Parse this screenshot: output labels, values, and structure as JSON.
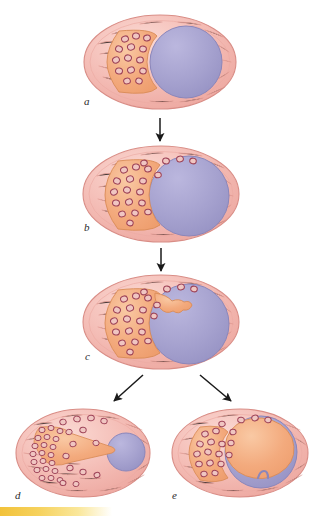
{
  "figure": {
    "type": "biomedical-illustration",
    "background_color": "#ffffff",
    "panel_count": 5,
    "flow": "a-to-b-to-c-then-branch-to-d-and-e"
  },
  "labels": {
    "a": "a",
    "b": "b",
    "c": "c",
    "d": "d",
    "e": "e"
  },
  "colors": {
    "stroma_pink": "#f2b3ac",
    "stroma_pink_light": "#f8cfc9",
    "stroma_outline": "#d98d86",
    "striation": "#e59c95",
    "antrum_purple": "#a3a0cc",
    "antrum_purple_light": "#b6b3d8",
    "antrum_outline": "#8a86bb",
    "granulosa_orange": "#f2a87a",
    "granulosa_orange_light": "#f7c39e",
    "granulosa_outline": "#d98b57",
    "cell_ring": "#9e4358",
    "cell_fill": "#f0c6c2",
    "arrow_black": "#1a1a1a",
    "footer_gold": "#f2c23a"
  },
  "panels": [
    {
      "id": "a",
      "label": "a",
      "stage": "primary-follicle",
      "description": "Oval stroma with orange granulosa crescent on left and large purple antrum on right",
      "antrum_fill": "purple",
      "antrum_size": "large",
      "cell_count": 14,
      "has_projection": false
    },
    {
      "id": "b",
      "label": "b",
      "stage": "secondary-follicle",
      "description": "Enlarged purple antrum with granulosa cells migrating over upper margin",
      "antrum_fill": "purple",
      "antrum_size": "larger",
      "cell_count": 20,
      "has_projection": false
    },
    {
      "id": "c",
      "label": "c",
      "stage": "early-luteinization",
      "description": "Orange granulosa projection extends into the purple antrum from the upper left",
      "antrum_fill": "purple",
      "antrum_size": "larger",
      "cell_count": 22,
      "has_projection": true
    },
    {
      "id": "d",
      "label": "d",
      "stage": "corpus-luteum-formation",
      "description": "Small purple antrum at right joined by an orange band to a dense crescent of luteinized cells at left",
      "antrum_fill": "purple",
      "antrum_size": "small",
      "cell_count": 48,
      "has_projection": true
    },
    {
      "id": "e",
      "label": "e",
      "stage": "corpus-haemorrhagicum",
      "description": "Large cavity filled with orange material bounded by a thin purple rim",
      "antrum_fill": "orange",
      "antrum_size": "large",
      "cell_count": 20,
      "has_projection": true
    }
  ],
  "arrows": [
    {
      "id": "arrow-a-b",
      "from": "a",
      "to": "b",
      "direction": "down"
    },
    {
      "id": "arrow-b-c",
      "from": "b",
      "to": "c",
      "direction": "down"
    },
    {
      "id": "arrow-c-d",
      "from": "c",
      "to": "d",
      "direction": "down-left"
    },
    {
      "id": "arrow-c-e",
      "from": "c",
      "to": "e",
      "direction": "down-right"
    }
  ],
  "footer": {
    "bar_label": "gold-gradient-bar"
  }
}
